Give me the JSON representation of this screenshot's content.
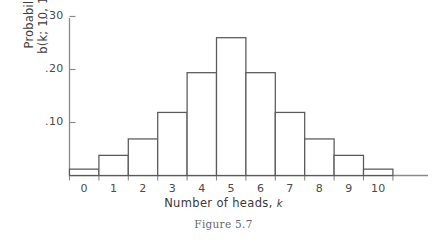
{
  "chart_data": {
    "type": "bar",
    "title": "",
    "caption": "Figure 5.7",
    "xlabel_text": "Number of heads, ",
    "xlabel_symbol": "k",
    "ylabel_line1": "Probability",
    "ylabel_line2": "b(k; 10, 1/2)",
    "categories": [
      "0",
      "1",
      "2",
      "3",
      "4",
      "5",
      "6",
      "7",
      "8",
      "9",
      "10"
    ],
    "values": [
      0.012,
      0.038,
      0.069,
      0.119,
      0.194,
      0.26,
      0.194,
      0.119,
      0.069,
      0.038,
      0.012
    ],
    "ylim": [
      0,
      0.32
    ],
    "xlim": [
      -0.5,
      10.5
    ],
    "ytick_values": [
      0.1,
      0.2,
      0.3
    ],
    "ytick_labels": [
      ".10",
      ".20",
      ".30"
    ],
    "grid": false,
    "legend": "none",
    "bar_fill": "#ffffff",
    "bar_stroke": "#595959",
    "axis_color": "#8a8a8a",
    "background": "#ffffff"
  }
}
